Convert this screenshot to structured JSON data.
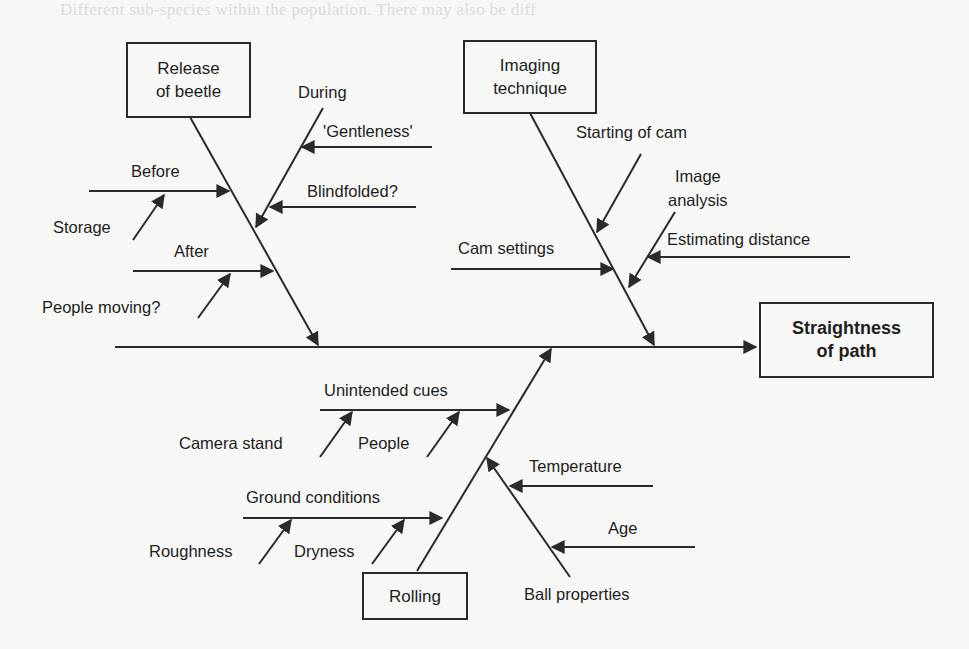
{
  "background_text": "Different sub-species within the population. There may also be diff",
  "colors": {
    "line": "#2a2a2a",
    "background": "#f7f7f5",
    "text": "#1e1e1e"
  },
  "effect": {
    "label": "Straightness of path",
    "line1": "Straightness",
    "line2": "of path"
  },
  "categories": [
    {
      "id": "release",
      "line1": "Release",
      "line2": "of beetle",
      "causes": [
        {
          "label": "Before",
          "subcauses": [
            "Storage"
          ]
        },
        {
          "label": "After",
          "subcauses": [
            "People moving?"
          ]
        },
        {
          "label": "During",
          "subcauses": [
            "'Gentleness'",
            "Blindfolded?"
          ]
        }
      ]
    },
    {
      "id": "imaging",
      "line1": "Imaging",
      "line2": "technique",
      "causes": [
        {
          "label": "Starting of cam",
          "subcauses": []
        },
        {
          "label": "Cam settings",
          "subcauses": []
        },
        {
          "label": "Image analysis",
          "line1": "Image",
          "line2": "analysis",
          "subcauses": [
            "Estimating distance"
          ]
        }
      ]
    },
    {
      "id": "rolling",
      "line1": "Rolling",
      "causes": [
        {
          "label": "Unintended cues",
          "subcauses": [
            "Camera stand",
            "People"
          ]
        },
        {
          "label": "Ground conditions",
          "subcauses": [
            "Roughness",
            "Dryness"
          ]
        },
        {
          "label": "Ball properties",
          "subcauses": [
            "Temperature",
            "Age"
          ]
        }
      ]
    }
  ]
}
